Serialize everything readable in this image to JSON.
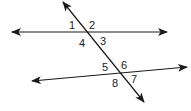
{
  "diagram": {
    "type": "parallel-lines-transversal",
    "line_color": "#1a1a1a",
    "lines": [
      {
        "name": "upper-line",
        "x1": 12,
        "y1": 32,
        "x2": 167,
        "y2": 32
      },
      {
        "name": "lower-line",
        "x1": 32,
        "y1": 81,
        "x2": 187,
        "y2": 67
      },
      {
        "name": "transversal",
        "x1": 63,
        "y1": 2,
        "x2": 144,
        "y2": 102
      }
    ],
    "angle_labels": [
      {
        "text": "1",
        "x": 69,
        "y": 29
      },
      {
        "text": "2",
        "x": 89,
        "y": 29
      },
      {
        "text": "4",
        "x": 79,
        "y": 47
      },
      {
        "text": "3",
        "x": 100,
        "y": 45
      },
      {
        "text": "5",
        "x": 102,
        "y": 71
      },
      {
        "text": "6",
        "x": 121,
        "y": 69
      },
      {
        "text": "8",
        "x": 112,
        "y": 87
      },
      {
        "text": "7",
        "x": 131,
        "y": 83
      }
    ]
  }
}
